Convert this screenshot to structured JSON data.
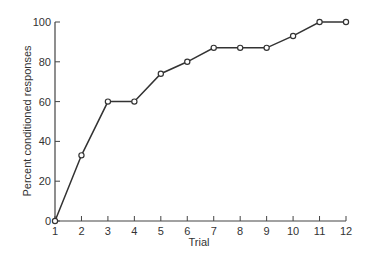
{
  "chart_data": {
    "type": "line",
    "title": "",
    "xlabel": "Trial",
    "ylabel": "Percent conditioned responses",
    "x": [
      1,
      2,
      3,
      4,
      5,
      6,
      7,
      8,
      9,
      10,
      11,
      12
    ],
    "series": [
      {
        "name": "Percent conditioned responses",
        "values": [
          0,
          33,
          60,
          60,
          74,
          80,
          87,
          87,
          87,
          93,
          100,
          100
        ],
        "marker": "open-circle",
        "color": "#333333"
      }
    ],
    "xticks": [
      "1",
      "2",
      "3",
      "4",
      "5",
      "6",
      "7",
      "8",
      "9",
      "10",
      "11",
      "12"
    ],
    "yticks": [
      "0",
      "20",
      "40",
      "60",
      "80",
      "100"
    ],
    "xlim": [
      1,
      12
    ],
    "ylim": [
      0,
      100
    ],
    "grid": false,
    "legend": null
  }
}
